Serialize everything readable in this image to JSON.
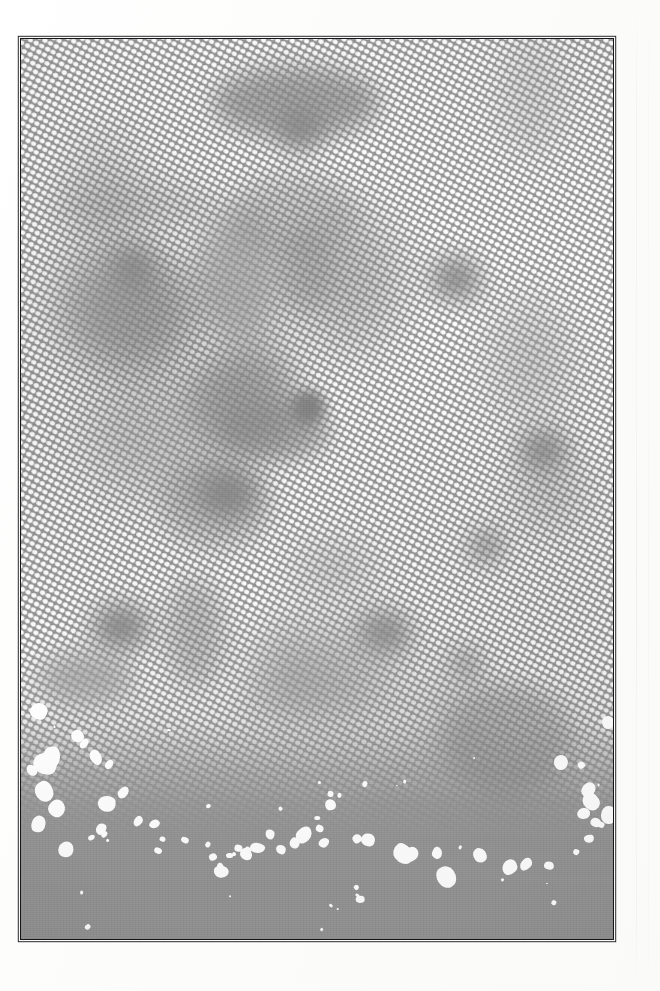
{
  "page": {
    "width": 660,
    "height": 991,
    "paper_color": "#fdfdfc",
    "caption": "",
    "title": "Halftone print scan"
  },
  "artwork": {
    "kind": "halftone-screen-print",
    "description": "Scanned halftone plate: white dot screen over flat gray ink, fading to a solid gray band with irregular white chips along the bottom",
    "ink_color": "#9a9a9a",
    "dot_color": "#ffffff",
    "frame_color": "#16161a",
    "frame_width_px": 1.6,
    "frame": {
      "left": 20,
      "top": 38,
      "width": 594,
      "height": 902
    },
    "screen": {
      "angle_deg": -17,
      "cell_px": 9.1,
      "dot_radius_px": 1.9,
      "coverage_note": "dot size varies with local tone; screen terminates near 86% of plate height"
    },
    "bands": [
      {
        "name": "upper-screen",
        "top_pct": 0,
        "bottom_pct": 62,
        "type": "full dot screen"
      },
      {
        "name": "fade-band",
        "top_pct": 62,
        "bottom_pct": 86,
        "type": "dot screen dissolving"
      },
      {
        "name": "solid-band",
        "top_pct": 86,
        "bottom_pct": 100,
        "type": "flat gray with white chips"
      }
    ],
    "voids": [
      {
        "x": 278,
        "y": 108,
        "w": 44,
        "h": 40,
        "blur": "soft"
      },
      {
        "x": 112,
        "y": 248,
        "w": 40,
        "h": 38,
        "blur": "soft"
      },
      {
        "x": 432,
        "y": 258,
        "w": 46,
        "h": 40,
        "blur": "soft"
      },
      {
        "x": 290,
        "y": 390,
        "w": 34,
        "h": 34,
        "blur": "deep"
      },
      {
        "x": 470,
        "y": 530,
        "w": 30,
        "h": 30,
        "blur": "soft"
      },
      {
        "x": 452,
        "y": 650,
        "w": 26,
        "h": 26,
        "blur": "soft"
      },
      {
        "x": 196,
        "y": 470,
        "w": 58,
        "h": 46,
        "blur": "soft"
      },
      {
        "x": 358,
        "y": 612,
        "w": 50,
        "h": 40,
        "blur": "soft"
      },
      {
        "x": 92,
        "y": 604,
        "w": 54,
        "h": 44,
        "blur": "soft"
      },
      {
        "x": 520,
        "y": 430,
        "w": 44,
        "h": 38,
        "blur": "soft"
      }
    ],
    "chips_count": 48
  }
}
